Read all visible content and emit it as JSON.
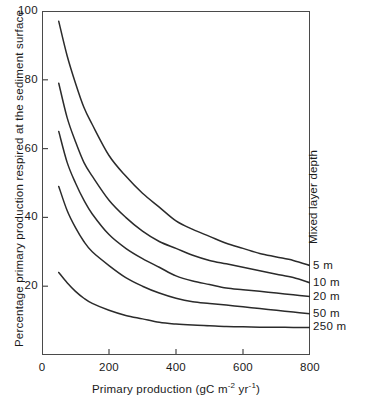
{
  "chart_data": {
    "type": "line",
    "title": "",
    "xlabel": "Primary production (gC m−2 yr−1)",
    "xlabel_parts": {
      "base": "Primary production (gC m",
      "sup1": "-2",
      "mid": " yr",
      "sup2": "-1",
      "close": ")"
    },
    "ylabel": "Percentage primary production respired at the sediment surface",
    "legend_title": "Mixed layer depth",
    "legend_position": "right-rotated",
    "grid": false,
    "xlim": [
      0,
      800
    ],
    "ylim": [
      0,
      100
    ],
    "xticks": [
      0,
      200,
      400,
      600,
      800
    ],
    "yticks": [
      20,
      40,
      60,
      80,
      100
    ],
    "xtick_labels": [
      "0",
      "200",
      "400",
      "600",
      "800"
    ],
    "ytick_labels": [
      "20",
      "40",
      "60",
      "80",
      "100"
    ],
    "series": [
      {
        "name": "5 m",
        "label": "5 m",
        "x": [
          50,
          75,
          100,
          125,
          150,
          200,
          250,
          300,
          350,
          400,
          450,
          500,
          550,
          600,
          650,
          700,
          750,
          800
        ],
        "values": [
          97,
          87,
          79,
          72,
          67,
          58,
          52,
          47,
          43,
          39,
          36.5,
          34.5,
          32.5,
          31,
          29.5,
          28.5,
          27.5,
          26
        ]
      },
      {
        "name": "10 m",
        "label": "10 m",
        "x": [
          50,
          75,
          100,
          125,
          150,
          200,
          250,
          300,
          350,
          400,
          450,
          500,
          550,
          600,
          650,
          700,
          750,
          800
        ],
        "values": [
          79,
          69,
          62,
          56,
          52,
          45,
          40,
          36,
          33,
          31,
          29,
          27.5,
          26.5,
          25.5,
          24.5,
          23.5,
          22.5,
          21
        ]
      },
      {
        "name": "20 m",
        "label": "20 m",
        "x": [
          50,
          75,
          100,
          125,
          150,
          200,
          250,
          300,
          350,
          400,
          450,
          500,
          550,
          600,
          650,
          700,
          750,
          800
        ],
        "values": [
          65,
          56,
          50,
          45,
          41,
          35,
          31,
          28,
          25.5,
          23,
          21.5,
          20.5,
          19.5,
          19,
          18.5,
          18,
          17.5,
          17
        ]
      },
      {
        "name": "50 m",
        "label": "50 m",
        "x": [
          50,
          75,
          100,
          125,
          150,
          200,
          250,
          300,
          350,
          400,
          450,
          500,
          550,
          600,
          650,
          700,
          750,
          800
        ],
        "values": [
          49,
          42,
          37,
          33,
          30,
          26,
          22.5,
          20,
          18,
          16.5,
          15.5,
          15,
          14.5,
          14,
          13.5,
          13,
          12.5,
          12
        ]
      },
      {
        "name": "250 m",
        "label": "250 m",
        "x": [
          50,
          75,
          100,
          125,
          150,
          200,
          250,
          300,
          350,
          400,
          450,
          500,
          550,
          600,
          650,
          700,
          750,
          800
        ],
        "values": [
          24,
          21,
          18.5,
          16.5,
          15,
          13,
          11.5,
          10.5,
          9.5,
          9,
          8.7,
          8.5,
          8.3,
          8.2,
          8.1,
          8.05,
          8.02,
          8
        ]
      }
    ],
    "colors": {
      "line": "#2b2b2b",
      "axis": "#4a4a4a",
      "text": "#1a1a1a",
      "background": "#ffffff"
    }
  }
}
